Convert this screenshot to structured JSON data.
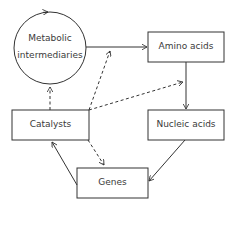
{
  "diagram": {
    "nodes": [
      {
        "id": "metabolic",
        "shape": "circle",
        "label_line1": "Metabolic",
        "label_line2": "intermediaries"
      },
      {
        "id": "amino",
        "shape": "box",
        "label": "Amino acids"
      },
      {
        "id": "nucleic",
        "shape": "box",
        "label": "Nucleic acids"
      },
      {
        "id": "genes",
        "shape": "box",
        "label": "Genes"
      },
      {
        "id": "catalysts",
        "shape": "box",
        "label": "Catalysts"
      }
    ],
    "edges": [
      {
        "from": "metabolic",
        "to": "metabolic",
        "style": "solid",
        "note": "self-cycle"
      },
      {
        "from": "metabolic",
        "to": "amino",
        "style": "solid"
      },
      {
        "from": "amino",
        "to": "nucleic",
        "style": "solid"
      },
      {
        "from": "nucleic",
        "to": "genes",
        "style": "solid"
      },
      {
        "from": "genes",
        "to": "catalysts",
        "style": "solid"
      },
      {
        "from": "catalysts",
        "to": "metabolic",
        "style": "dashed"
      },
      {
        "from": "catalysts",
        "to": "metabolic-amino-edge",
        "style": "dashed"
      },
      {
        "from": "catalysts",
        "to": "amino-nucleic-edge",
        "style": "dashed"
      },
      {
        "from": "catalysts",
        "to": "genes",
        "style": "dashed"
      }
    ],
    "colors": {
      "stroke": "#333333",
      "text": "#3a3a3a",
      "background": "#ffffff"
    }
  }
}
